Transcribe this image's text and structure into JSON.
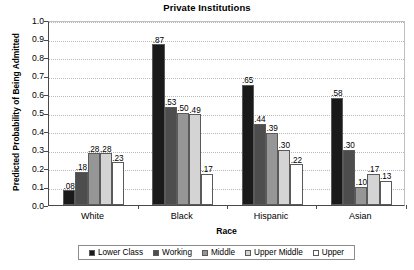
{
  "chart_data": {
    "type": "bar",
    "title": "Private Institutions",
    "xlabel": "Race",
    "ylabel": "Predicted Probability of Being Admitted",
    "categories": [
      "White",
      "Black",
      "Hispanic",
      "Asian"
    ],
    "ylim": [
      0.0,
      1.0
    ],
    "ytick_labels": [
      "1.0",
      "0.9",
      "0.8",
      "0.7",
      "0.6",
      "0.5",
      "0.4",
      "0.3",
      "0.2",
      "0.1",
      "0.0"
    ],
    "ytick_values": [
      1.0,
      0.9,
      0.8,
      0.7,
      0.6,
      0.5,
      0.4,
      0.3,
      0.2,
      0.1,
      0.0
    ],
    "grid": true,
    "legend_position": "bottom",
    "series": [
      {
        "name": "Lower Class",
        "color": "#1a1a1a",
        "values": [
          0.08,
          0.87,
          0.65,
          0.58
        ],
        "labels": [
          ".08",
          ".87",
          ".65",
          ".58"
        ]
      },
      {
        "name": "Working",
        "color": "#4d4d4d",
        "values": [
          0.18,
          0.53,
          0.44,
          0.3
        ],
        "labels": [
          ".18",
          ".53",
          ".44",
          ".30"
        ]
      },
      {
        "name": "Middle",
        "color": "#969696",
        "values": [
          0.28,
          0.5,
          0.39,
          0.1
        ],
        "labels": [
          ".28",
          ".50",
          ".39",
          ".10"
        ]
      },
      {
        "name": "Upper Middle",
        "color": "#d4d4d4",
        "values": [
          0.28,
          0.49,
          0.3,
          0.17
        ],
        "labels": [
          ".28",
          ".49",
          ".30",
          ".17"
        ]
      },
      {
        "name": "Upper",
        "color": "#ffffff",
        "values": [
          0.23,
          0.17,
          0.22,
          0.13
        ],
        "labels": [
          ".23",
          ".17",
          ".22",
          ".13"
        ]
      }
    ]
  }
}
